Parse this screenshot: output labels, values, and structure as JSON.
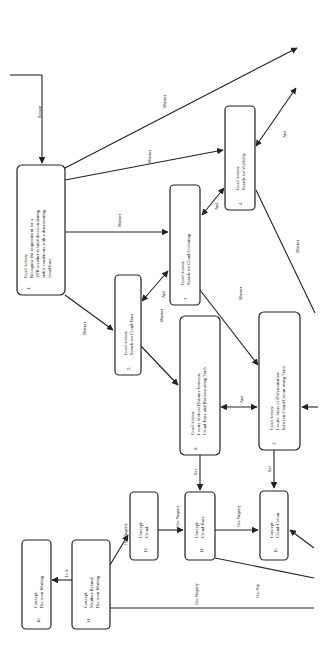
{
  "diagram": {
    "orientation": "rotated-90-ccw",
    "nodes": [
      {
        "id": "1",
        "num": "1.",
        "lines": [
          "Goal/Action:",
          "Recognise the requirement for a",
          "VFR weather-related decision during",
          "stable conditions with a deteriorating",
          "cloud base"
        ]
      },
      {
        "id": "2",
        "num": "2.",
        "lines": [
          "Goal/Action:",
          "Search for Cloud-Base"
        ]
      },
      {
        "id": "3",
        "num": "3.",
        "lines": [
          "Goal/Action:",
          "Search for Cloud Colouring"
        ]
      },
      {
        "id": "4",
        "num": "4.",
        "lines": [
          "Goal/Action:",
          "Search for Visibility"
        ]
      },
      {
        "id": "6",
        "num": "6.",
        "lines": [
          "Goal/Action:",
          "Locate Vertical Distance between",
          "Cloud-Base and Horizon along Track"
        ]
      },
      {
        "id": "7",
        "num": "7.",
        "lines": [
          "Goal/Action:",
          "Locate Areas of Differentiation",
          "between Cloud Colour along Track"
        ]
      },
      {
        "id": "10",
        "num": "10.",
        "lines": [
          "Concept:",
          "Decision-Making"
        ]
      },
      {
        "id": "11",
        "num": "11.",
        "lines": [
          "Concept:",
          "Weather-Related",
          "Decision-Making"
        ]
      },
      {
        "id": "13",
        "num": "13.",
        "lines": [
          "Concept:",
          "Cloud"
        ]
      },
      {
        "id": "14",
        "num": "14.",
        "lines": [
          "Concept:",
          "Cloud-Base"
        ]
      },
      {
        "id": "15",
        "num": "15.",
        "lines": [
          "Concept:",
          "Cloud-Colour"
        ]
      }
    ],
    "edges": {
      "reason": "Reason",
      "manner_1": "Manner",
      "manner_2": "Manner",
      "manner_3": "Manner",
      "manner_4": "Manner",
      "manner_5": "Manner",
      "manner_6": "Manner",
      "and_1": "And",
      "and_2": "And",
      "and_3": "And",
      "and_4": "And",
      "ref_1": "Ref",
      "ref_2": "Ref",
      "is_a": "Is-A",
      "has_property_1": "Has Property",
      "has_property_2": "Has Property",
      "has_property_3": "Has Property",
      "has_property_4": "Has Property",
      "has_part": "Has Part"
    }
  }
}
